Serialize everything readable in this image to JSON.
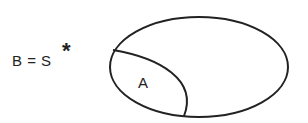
{
  "diagram": {
    "equation": "B = S",
    "superscript": "*",
    "set_inner_label": "A",
    "stroke_color": "#222222",
    "background": "#ffffff"
  }
}
